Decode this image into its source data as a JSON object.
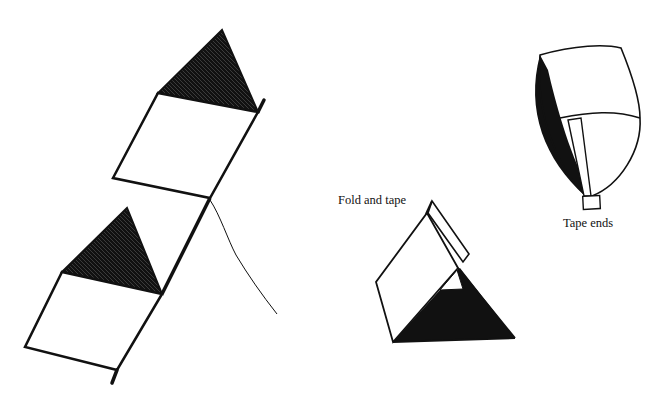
{
  "figure": {
    "colors": {
      "ink": "#111111",
      "paper": "#ffffff"
    }
  },
  "labels": {
    "fold_and_tape": "Fold and tape",
    "tape_ends": "Tape ends"
  },
  "parts": [
    {
      "id": "box-kite",
      "description": "Assembled two-cell box kite with bridle string"
    },
    {
      "id": "folded-cell",
      "description": "Triangular cell folded with taped flap"
    },
    {
      "id": "cell-end-view",
      "description": "Rounded cell with tape strip across the ends"
    }
  ]
}
